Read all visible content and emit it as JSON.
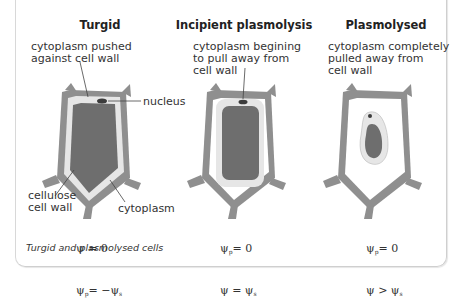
{
  "figure": {
    "caption": "Turgid and plasmolysed cells",
    "colors": {
      "cell_wall": "#8f8f8f",
      "cytoplasm": "#e6e6e6",
      "vacuole": "#6e6e6e",
      "nucleus": "#3c3c3c",
      "background": "#ffffff"
    },
    "panels": [
      {
        "title": "Turgid",
        "annotation": "cytoplasm pushed\nagainst cell wall",
        "labels": {
          "nucleus": "nucleus",
          "cell_wall": "cellulose\ncell wall",
          "cytoplasm": "cytoplasm"
        },
        "equations": {
          "line1": {
            "lhs": "ψ",
            "sub": "",
            "rel": " = 0"
          },
          "line2": {
            "lhs": "ψ",
            "sub": "p",
            "rel": "= −ψ",
            "rsub": "s"
          }
        }
      },
      {
        "title": "Incipient plasmolysis",
        "annotation": "cytoplasm begining\nto pull away from\ncell wall",
        "equations": {
          "line1": {
            "lhs": "ψ",
            "sub": "p",
            "rel": "= 0"
          },
          "line2": {
            "lhs": "ψ",
            "sub": "",
            "rel": " = ψ",
            "rsub": "s"
          }
        }
      },
      {
        "title": "Plasmolysed",
        "annotation": "cytoplasm completely\npulled away from\ncell wall",
        "equations": {
          "line1": {
            "lhs": "ψ",
            "sub": "p",
            "rel": "= 0"
          },
          "line2": {
            "lhs": "ψ",
            "sub": "",
            "rel": " > ψ",
            "rsub": "s"
          }
        }
      }
    ]
  }
}
